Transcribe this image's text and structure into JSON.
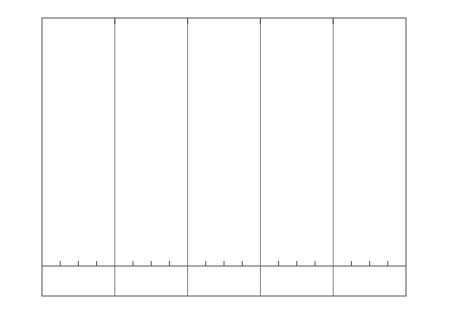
{
  "chart_data": {
    "type": "line",
    "title": "",
    "xlabel": "Weeks",
    "ylabel": "Weight (lb.)",
    "ylabel_right": "Weight (kg.)",
    "xlim": [
      0,
      80
    ],
    "ylim": [
      0,
      1150
    ],
    "x_ticks": [
      0,
      16,
      32,
      48,
      64,
      80
    ],
    "y_ticks": [
      0,
      100,
      200,
      300,
      400,
      500,
      600,
      700,
      800,
      900,
      1000,
      1100
    ],
    "y_right_ticks": [
      100,
      200,
      300,
      400,
      500
    ],
    "grid": false,
    "legend_position": "upper-left",
    "legend_title": "Feeding level :",
    "x": [
      0,
      4,
      8,
      12,
      16,
      20,
      24,
      28,
      32,
      36,
      40,
      44,
      48,
      52,
      56,
      60,
      64,
      68,
      72,
      76,
      80
    ],
    "series": [
      {
        "name": "Low",
        "style": "solid",
        "values": [
          95,
          110,
          130,
          145,
          170,
          185,
          215,
          235,
          255,
          280,
          310,
          330,
          360,
          390,
          425,
          450,
          475,
          520,
          540,
          570,
          565
        ]
      },
      {
        "name": "Medium",
        "style": "dashed-short",
        "values": [
          95,
          130,
          160,
          195,
          225,
          255,
          300,
          340,
          385,
          430,
          465,
          500,
          545,
          600,
          660,
          710,
          745,
          820,
          860,
          880,
          930
        ]
      },
      {
        "name": "High",
        "style": "dashed-long",
        "values": [
          95,
          135,
          175,
          220,
          265,
          320,
          370,
          430,
          490,
          545,
          600,
          650,
          705,
          760,
          820,
          870,
          920,
          1040,
          1070,
          1105,
          1150
        ]
      },
      {
        "name": "Ragsdale normal",
        "style": "dotted",
        "values": [
          95,
          130,
          165,
          200,
          235,
          270,
          310,
          355,
          400,
          450,
          495,
          530,
          575,
          620,
          670,
          710,
          745,
          785,
          820,
          855,
          895
        ]
      }
    ],
    "puberty_markers": [
      {
        "week": 38,
        "weight": 550,
        "series": "High"
      },
      {
        "week": 51,
        "weight": 590,
        "series": "Medium"
      },
      {
        "week": 73,
        "weight": 540,
        "series": "Low"
      }
    ],
    "annotations": [
      "Avg. 20 calves",
      "Avg. 16 calves",
      "Avg. 12 calves",
      "Avg. 8 calves",
      "Avg. 4 calves"
    ]
  },
  "legend": {
    "title": "Feeding level :",
    "items": [
      "Low",
      "Medium",
      "High",
      "Ragsdale normal",
      "Puberty"
    ]
  },
  "axes": {
    "x_label": "Weeks",
    "y_left_label": "Weight (lb.)",
    "y_right_label": "Weight (kg.)"
  },
  "periods": [
    "Avg. 20 calves",
    "Avg. 16 calves",
    "Avg. 12 calves",
    "Avg. 8 calves",
    "Avg. 4 calves"
  ]
}
